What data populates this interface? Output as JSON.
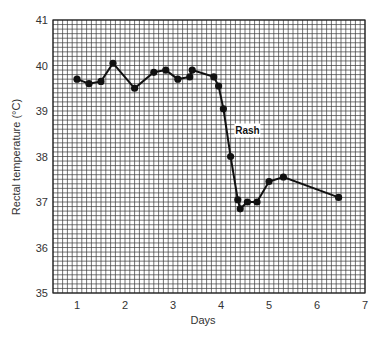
{
  "chart_data": {
    "type": "line",
    "title": "",
    "xlabel": "Days",
    "ylabel": "Rectal temperature (°C)",
    "xlim": [
      0.5,
      7
    ],
    "ylim": [
      35,
      41
    ],
    "x_ticks": [
      1,
      2,
      3,
      4,
      5,
      6,
      7
    ],
    "y_ticks": [
      35,
      36,
      37,
      38,
      39,
      40,
      41
    ],
    "grid": true,
    "grid_minor_step_x": 0.1,
    "grid_minor_step_y": 0.1,
    "legend": null,
    "series": [
      {
        "name": "Rectal temperature",
        "color": "#111111",
        "marker": "circle",
        "x": [
          1.0,
          1.25,
          1.5,
          1.75,
          2.2,
          2.6,
          2.85,
          3.1,
          3.35,
          3.4,
          3.85,
          3.95,
          4.05,
          4.2,
          4.35,
          4.4,
          4.55,
          4.75,
          5.0,
          5.3,
          6.45
        ],
        "y": [
          39.7,
          39.6,
          39.65,
          40.05,
          39.5,
          39.85,
          39.9,
          39.7,
          39.75,
          39.9,
          39.75,
          39.55,
          39.05,
          38.0,
          37.05,
          36.85,
          37.0,
          37.0,
          37.45,
          37.55,
          37.1
        ]
      }
    ],
    "annotations": [
      {
        "text": "Rash",
        "x": 4.55,
        "y": 38.55
      }
    ]
  },
  "labels": {
    "xlabel": "Days",
    "ylabel": "Rectal temperature (°C)",
    "rash": "Rash"
  }
}
